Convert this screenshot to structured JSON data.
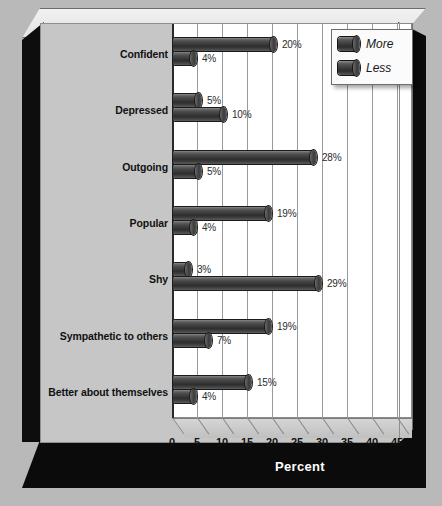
{
  "chart_data": {
    "type": "bar",
    "orientation": "horizontal",
    "title": "",
    "xlabel": "Percent",
    "ylabel": "",
    "xlim": [
      0,
      48
    ],
    "xticks": [
      0,
      5,
      10,
      15,
      20,
      25,
      30,
      35,
      40,
      45
    ],
    "xtick_labels": [
      "0",
      "5",
      "10",
      "15",
      "20",
      "25",
      "30",
      "35",
      "40",
      "45"
    ],
    "grid": true,
    "legend_position": "top-right",
    "value_suffix": "%",
    "categories": [
      "Confident",
      "Depressed",
      "Outgoing",
      "Popular",
      "Shy",
      "Sympathetic to others",
      "Better about themselves"
    ],
    "series": [
      {
        "name": "More",
        "values": [
          20,
          5,
          28,
          19,
          3,
          19,
          15
        ],
        "labels": [
          "20%",
          "5%",
          "28%",
          "19%",
          "3%",
          "19%",
          "15%"
        ]
      },
      {
        "name": "Less",
        "values": [
          4,
          10,
          5,
          4,
          29,
          7,
          4
        ],
        "labels": [
          "4%",
          "10%",
          "5%",
          "4%",
          "29%",
          "7%",
          "4%"
        ]
      }
    ]
  },
  "legend": {
    "items": [
      {
        "label": "More"
      },
      {
        "label": "Less"
      }
    ]
  },
  "colors": {
    "background": "#b9b9b9",
    "panel": "#c6c6c6",
    "plot": "#ffffff",
    "bar": "#3a3a3a",
    "frame_shadow": "#0b0b0b",
    "gridline": "#9a9a9a",
    "text": "#111111",
    "axis_title_text": "#ffffff"
  }
}
